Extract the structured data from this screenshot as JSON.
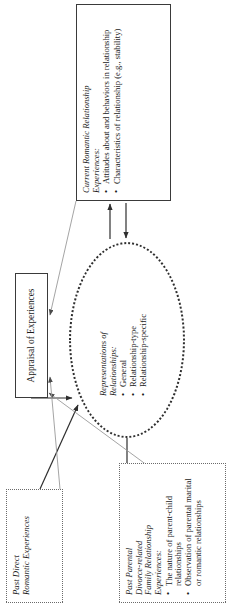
{
  "figure": {
    "orientation": "rotated-90-ccw",
    "background": "#ffffff",
    "line_color": "#3a3a3a",
    "thin_line_color": "#9a9a9a"
  },
  "nodes": {
    "current_romantic": {
      "title": "Current Romantic Relationship\nExperiences:",
      "bullets": [
        "Attitudes about and behaviors in relationship",
        "Characteristics of relationship (e.g., stability)"
      ],
      "border": "solid"
    },
    "appraisal": {
      "label": "Appraisal of Experiences",
      "border": "solid"
    },
    "representations": {
      "title": "Representations of\nRelationships:",
      "bullets": [
        "General",
        "Relationship-type",
        "Relationship-specific"
      ],
      "border": "dotted-ellipse"
    },
    "past_family": {
      "title": "Past Parental\nDivorce-related\nFamily Relationship\nExperiences:",
      "bullets": [
        "The nature of parent-child relationships",
        "Observation of parental marital or romantic relationships"
      ],
      "border": "dotted"
    },
    "past_direct": {
      "title": "Past Direct\nRomantic Experiences",
      "bullets": [],
      "border": "dotted"
    }
  },
  "connectors": [
    {
      "name": "representations-to-current",
      "from": "representations",
      "to": "current_romantic",
      "style": "solid-arrow"
    },
    {
      "name": "current-to-representations",
      "from": "current_romantic",
      "to": "representations",
      "style": "solid-arrow"
    },
    {
      "name": "appraisal-to-representations",
      "from": "appraisal",
      "to": "representations",
      "style": "solid-arrow"
    },
    {
      "name": "current-to-appraisal",
      "from": "current_romantic",
      "to": "appraisal",
      "style": "thin-arrow"
    },
    {
      "name": "past-family-to-representations",
      "from": "past_family",
      "to": "representations",
      "style": "solid-arrow"
    },
    {
      "name": "past-direct-to-representations",
      "from": "past_direct",
      "to": "representations",
      "style": "solid-arrow"
    },
    {
      "name": "past-family-to-appraisal",
      "from": "past_family",
      "to": "appraisal",
      "style": "thin-arrow"
    },
    {
      "name": "past-direct-to-appraisal",
      "from": "past_direct",
      "to": "appraisal",
      "style": "thin-arrow"
    }
  ]
}
